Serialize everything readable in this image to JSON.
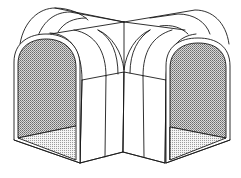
{
  "diagram": {
    "subject": "L-shaped arched tunnel corner piece",
    "view": "isometric line drawing",
    "colors": {
      "line": "#1a1a1a",
      "background": "#ffffff",
      "inner_wall_shade": "#9a9a9a",
      "floor_shade": "#c4c4c4"
    },
    "parts": [
      {
        "id": "left-opening",
        "label": "Left arched opening"
      },
      {
        "id": "right-opening",
        "label": "Right arched opening"
      },
      {
        "id": "roof-arches",
        "label": "Curved roof ribs"
      },
      {
        "id": "inner-corner",
        "label": "Inner corner walls"
      }
    ]
  }
}
